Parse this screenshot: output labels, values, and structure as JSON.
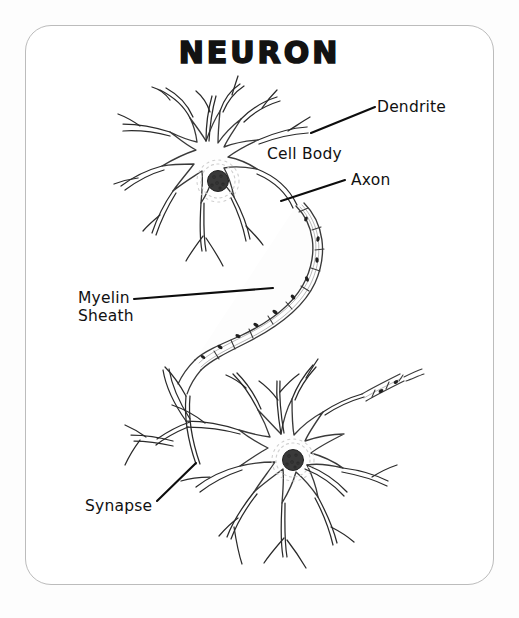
{
  "page": {
    "background_color": "#fdfdfd",
    "card_background": "#ffffff",
    "card_border_color": "#bcbcbc",
    "ink_color": "#111111"
  },
  "title": {
    "text": "NEURON"
  },
  "labels": {
    "dendrite": "Dendrite",
    "cell_body": "Cell Body",
    "axon": "Axon",
    "myelin_sheath": "Myelin\nSheath",
    "myelin_sheath_line1": "Myelin",
    "myelin_sheath_line2": "Sheath",
    "synapse": "Synapse"
  },
  "diagram": {
    "type": "labeled-biological-illustration",
    "subject": "Neuron",
    "style": "black-and-white pen-and-ink line drawing",
    "structures": [
      {
        "name": "upper-neuron",
        "parts": [
          "dendrites",
          "cell body",
          "nucleus",
          "axon hillock",
          "myelinated axon"
        ]
      },
      {
        "name": "lower-neuron",
        "parts": [
          "dendrites",
          "cell body",
          "nucleus",
          "axon",
          "synapse"
        ]
      }
    ],
    "leader_lines": [
      {
        "label": "Dendrite",
        "from": [
          378,
          107
        ],
        "to": [
          311,
          133
        ]
      },
      {
        "label": "Axon",
        "from": [
          347,
          180
        ],
        "to": [
          281,
          201
        ]
      },
      {
        "label": "Myelin Sheath",
        "from": [
          134,
          299
        ],
        "to": [
          273,
          288
        ]
      },
      {
        "label": "Synapse",
        "from": [
          158,
          501
        ],
        "to": [
          196,
          464
        ]
      }
    ]
  }
}
